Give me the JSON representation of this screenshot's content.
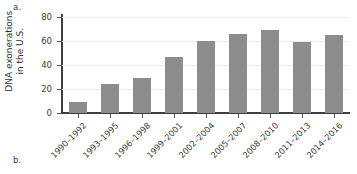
{
  "panels": {
    "a_label": "a.",
    "b_label": "b."
  },
  "chart_data": {
    "type": "bar",
    "title": "",
    "xlabel": "",
    "ylabel": "DNA exonerations in the U.S.",
    "ylabel_lines": [
      "DNA exonerations",
      "in the U.S."
    ],
    "categories": [
      "1990–1992",
      "1993–1995",
      "1996–1998",
      "1999–2001",
      "2002–2004",
      "2005–2007",
      "2008–2010",
      "2011–2013",
      "2014–2016"
    ],
    "values": [
      9,
      24,
      29,
      47,
      60,
      66,
      69,
      59,
      65
    ],
    "ylim": [
      0,
      80
    ],
    "yticks": [
      0,
      20,
      40,
      60,
      80
    ],
    "ytick_labels": [
      "0",
      "20",
      "40",
      "60",
      "80"
    ],
    "grid": "horizontal",
    "legend": "none",
    "bar_color": "#8d8d8d",
    "axis_color": "#3f3f3f",
    "gridline_color": "#ececec"
  }
}
